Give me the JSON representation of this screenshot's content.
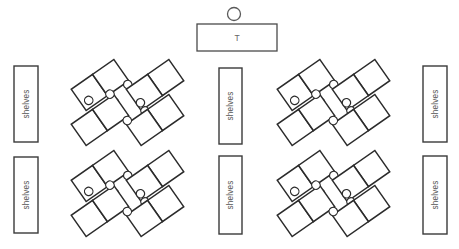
{
  "diagram": {
    "type": "floor-plan",
    "canvas": {
      "width": 459,
      "height": 249,
      "background": "#ffffff"
    },
    "colors": {
      "desk_stroke": "#2b2b2b",
      "shelf_stroke": "#3a3a3a",
      "teacher_stroke": "#4a4a4a",
      "label_text": "#555555",
      "fill": "#ffffff"
    },
    "teacher": {
      "desk_label": "T",
      "seat_icon": "teacher-circle-icon",
      "desk": {
        "x": 197,
        "y": 24,
        "width": 80,
        "height": 27
      },
      "seat": {
        "cx": 234,
        "cy": 14,
        "r": 6.5
      }
    },
    "shelves": {
      "label": "shelves",
      "units": [
        {
          "id": "left-top",
          "x": 14,
          "y": 66,
          "width": 24,
          "height": 76
        },
        {
          "id": "left-bottom",
          "x": 14,
          "y": 157,
          "width": 24,
          "height": 76
        },
        {
          "id": "middle-top",
          "x": 219,
          "y": 68,
          "width": 23,
          "height": 76
        },
        {
          "id": "middle-bottom",
          "x": 219,
          "y": 156,
          "width": 23,
          "height": 78
        },
        {
          "id": "right-top",
          "x": 423,
          "y": 66,
          "width": 24,
          "height": 76
        },
        {
          "id": "right-bottom",
          "x": 423,
          "y": 156,
          "width": 24,
          "height": 78
        }
      ]
    },
    "desk_clusters": {
      "count": 8,
      "desks_per_cluster": 2,
      "students_per_cluster": 2,
      "total_desks": 16,
      "total_students": 16,
      "rotation_deg": -35,
      "desk_size": 26,
      "student_radius": 4.2,
      "items": [
        {
          "id": "group-left-top-col1-upper",
          "cx": 100,
          "cy": 85,
          "mirror": false
        },
        {
          "id": "group-left-top-col1-lower",
          "cx": 100,
          "cy": 120,
          "mirror": false,
          "students_above": true
        },
        {
          "id": "group-left-top-col2-upper",
          "cx": 155,
          "cy": 85,
          "mirror": true
        },
        {
          "id": "group-left-top-col2-lower",
          "cx": 155,
          "cy": 120,
          "mirror": true,
          "students_above": true
        },
        {
          "id": "group-left-bottom-col1-upper",
          "cx": 100,
          "cy": 176,
          "mirror": false
        },
        {
          "id": "group-left-bottom-col1-lower",
          "cx": 100,
          "cy": 211,
          "mirror": false,
          "students_above": true
        },
        {
          "id": "group-left-bottom-col2-upper",
          "cx": 155,
          "cy": 176,
          "mirror": true
        },
        {
          "id": "group-left-bottom-col2-lower",
          "cx": 155,
          "cy": 211,
          "mirror": true,
          "students_above": true
        },
        {
          "id": "group-right-top-col1-upper",
          "cx": 306,
          "cy": 85,
          "mirror": false
        },
        {
          "id": "group-right-top-col1-lower",
          "cx": 306,
          "cy": 120,
          "mirror": false,
          "students_above": true
        },
        {
          "id": "group-right-top-col2-upper",
          "cx": 361,
          "cy": 85,
          "mirror": true
        },
        {
          "id": "group-right-top-col2-lower",
          "cx": 361,
          "cy": 120,
          "mirror": true,
          "students_above": true
        },
        {
          "id": "group-right-bottom-col1-upper",
          "cx": 306,
          "cy": 176,
          "mirror": false
        },
        {
          "id": "group-right-bottom-col1-lower",
          "cx": 306,
          "cy": 211,
          "mirror": false,
          "students_above": true
        },
        {
          "id": "group-right-bottom-col2-upper",
          "cx": 361,
          "cy": 176,
          "mirror": true
        },
        {
          "id": "group-right-bottom-col2-lower",
          "cx": 361,
          "cy": 211,
          "mirror": true,
          "students_above": true
        }
      ]
    }
  }
}
